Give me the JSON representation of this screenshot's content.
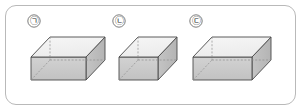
{
  "figure": {
    "frame": {
      "border_color": "#b9b9b9",
      "background_color": "#ffffff",
      "corner_radius": 11
    },
    "palette": {
      "outline": "#4a4a4a",
      "hidden_edge": "#8e8e8e",
      "top_face": "#f2f2f2",
      "front_face": "#c9c9c9",
      "side_face": "#bdbdbd",
      "inner_face": "#dedede",
      "floor_face": "#d6d6d6",
      "label_color": "#2b2b2b"
    },
    "boxes": [
      {
        "id": "box-1",
        "label": "㉠",
        "label_x": 34,
        "label_y": 24,
        "width_units": 3,
        "depth_units": 2,
        "height_units": 2,
        "open_top": true,
        "geometry": {
          "front_bottom_left": [
            31,
            80
          ],
          "front_bottom_right": [
            86,
            80
          ],
          "front_top_left": [
            31,
            57
          ],
          "front_top_right": [
            86,
            57
          ],
          "back_top_left": [
            50,
            37
          ],
          "back_top_right": [
            105,
            37
          ],
          "back_bottom_left": [
            50,
            60
          ],
          "back_bottom_right": [
            105,
            60
          ]
        }
      },
      {
        "id": "box-2",
        "label": "㉡",
        "label_x": 119,
        "label_y": 24,
        "width_units": 2,
        "depth_units": 2,
        "height_units": 2,
        "open_top": true,
        "geometry": {
          "front_bottom_left": [
            119,
            80
          ],
          "front_bottom_right": [
            158,
            80
          ],
          "front_top_left": [
            119,
            57
          ],
          "front_top_right": [
            158,
            57
          ],
          "back_top_left": [
            138,
            37
          ],
          "back_top_right": [
            177,
            37
          ],
          "back_bottom_left": [
            138,
            60
          ],
          "back_bottom_right": [
            177,
            60
          ]
        }
      },
      {
        "id": "box-3",
        "label": "㉢",
        "label_x": 196,
        "label_y": 24,
        "width_units": 3,
        "depth_units": 2,
        "height_units": 2,
        "open_top": true,
        "geometry": {
          "front_bottom_left": [
            193,
            80
          ],
          "front_bottom_right": [
            252,
            80
          ],
          "front_top_left": [
            193,
            57
          ],
          "front_top_right": [
            252,
            57
          ],
          "back_top_left": [
            212,
            37
          ],
          "back_top_right": [
            271,
            37
          ],
          "back_bottom_left": [
            212,
            60
          ],
          "back_bottom_right": [
            271,
            60
          ]
        }
      }
    ]
  }
}
